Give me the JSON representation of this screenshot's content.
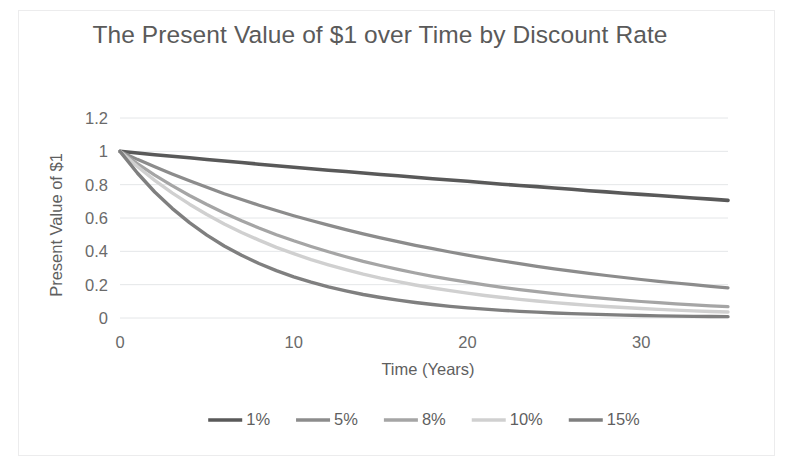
{
  "chart_data": {
    "type": "line",
    "title": "The Present Value of $1 over Time by Discount Rate",
    "xlabel": "Time (Years)",
    "ylabel": "Present Value of $1",
    "xlim": [
      0,
      35
    ],
    "ylim": [
      0,
      1.2
    ],
    "x_ticks": [
      "0",
      "10",
      "20",
      "30"
    ],
    "x_tick_values": [
      0,
      10,
      20,
      30
    ],
    "y_ticks": [
      "0",
      "0.2",
      "0.4",
      "0.6",
      "0.8",
      "1",
      "1.2"
    ],
    "y_tick_values": [
      0,
      0.2,
      0.4,
      0.6,
      0.8,
      1,
      1.2
    ],
    "grid": "horizontal",
    "legend_position": "bottom",
    "x": [
      0,
      1,
      2,
      3,
      4,
      5,
      6,
      7,
      8,
      9,
      10,
      11,
      12,
      13,
      14,
      15,
      16,
      17,
      18,
      19,
      20,
      21,
      22,
      23,
      24,
      25,
      26,
      27,
      28,
      29,
      30,
      31,
      32,
      33,
      34,
      35
    ],
    "series": [
      {
        "name": "1%",
        "color": "#595959",
        "values": [
          1,
          0.99,
          0.98,
          0.971,
          0.961,
          0.951,
          0.942,
          0.933,
          0.923,
          0.914,
          0.905,
          0.896,
          0.887,
          0.879,
          0.87,
          0.861,
          0.853,
          0.844,
          0.836,
          0.828,
          0.82,
          0.811,
          0.803,
          0.795,
          0.788,
          0.78,
          0.772,
          0.764,
          0.757,
          0.749,
          0.742,
          0.735,
          0.727,
          0.72,
          0.713,
          0.706
        ]
      },
      {
        "name": "5%",
        "color": "#8c8c8c",
        "values": [
          1,
          0.952,
          0.907,
          0.864,
          0.823,
          0.784,
          0.746,
          0.711,
          0.677,
          0.645,
          0.614,
          0.585,
          0.557,
          0.53,
          0.505,
          0.481,
          0.458,
          0.436,
          0.416,
          0.396,
          0.377,
          0.359,
          0.342,
          0.326,
          0.31,
          0.295,
          0.281,
          0.268,
          0.255,
          0.243,
          0.231,
          0.22,
          0.21,
          0.2,
          0.19,
          0.181
        ]
      },
      {
        "name": "8%",
        "color": "#a5a5a5",
        "values": [
          1,
          0.926,
          0.857,
          0.794,
          0.735,
          0.681,
          0.63,
          0.583,
          0.54,
          0.5,
          0.463,
          0.429,
          0.397,
          0.368,
          0.34,
          0.315,
          0.292,
          0.27,
          0.25,
          0.232,
          0.215,
          0.199,
          0.184,
          0.17,
          0.158,
          0.146,
          0.135,
          0.125,
          0.116,
          0.107,
          0.099,
          0.092,
          0.085,
          0.079,
          0.073,
          0.068
        ]
      },
      {
        "name": "10%",
        "color": "#d0d0d0",
        "values": [
          1,
          0.909,
          0.826,
          0.751,
          0.683,
          0.621,
          0.564,
          0.513,
          0.467,
          0.424,
          0.386,
          0.35,
          0.319,
          0.29,
          0.263,
          0.239,
          0.218,
          0.198,
          0.18,
          0.164,
          0.149,
          0.135,
          0.123,
          0.112,
          0.102,
          0.092,
          0.084,
          0.076,
          0.069,
          0.063,
          0.057,
          0.052,
          0.047,
          0.043,
          0.039,
          0.036
        ]
      },
      {
        "name": "15%",
        "color": "#7f7f7f",
        "values": [
          1,
          0.87,
          0.756,
          0.658,
          0.572,
          0.497,
          0.432,
          0.376,
          0.327,
          0.284,
          0.247,
          0.215,
          0.187,
          0.163,
          0.141,
          0.123,
          0.107,
          0.093,
          0.081,
          0.07,
          0.061,
          0.053,
          0.046,
          0.04,
          0.035,
          0.03,
          0.026,
          0.023,
          0.02,
          0.017,
          0.015,
          0.013,
          0.011,
          0.01,
          0.009,
          0.008
        ]
      }
    ]
  },
  "legend": {
    "items": [
      {
        "label": "1%"
      },
      {
        "label": "5%"
      },
      {
        "label": "8%"
      },
      {
        "label": "10%"
      },
      {
        "label": "15%"
      }
    ]
  }
}
